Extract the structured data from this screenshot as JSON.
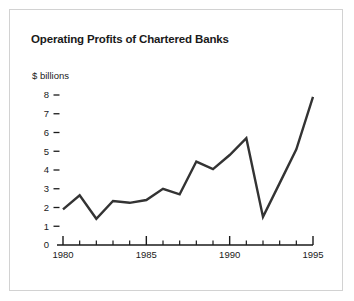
{
  "figure": {
    "title": "Operating Profits of Chartered Banks",
    "border_color": "#d2d2d2",
    "background": "#ffffff"
  },
  "chart_data": {
    "type": "line",
    "title": "Operating Profits of Chartered Banks",
    "xlabel": "",
    "ylabel": "$ billions",
    "ylabel_text": "$ billions",
    "x": [
      1980,
      1981,
      1982,
      1983,
      1984,
      1985,
      1986,
      1987,
      1988,
      1989,
      1990,
      1991,
      1992,
      1993,
      1994,
      1995
    ],
    "values": [
      1.9,
      2.65,
      1.4,
      2.35,
      2.25,
      2.4,
      3.0,
      2.7,
      4.45,
      4.05,
      4.8,
      5.7,
      1.5,
      3.3,
      5.1,
      7.9
    ],
    "series": [
      {
        "name": "Operating profits",
        "values": [
          1.9,
          2.65,
          1.4,
          2.35,
          2.25,
          2.4,
          3.0,
          2.7,
          4.45,
          4.05,
          4.8,
          5.7,
          1.5,
          3.3,
          5.1,
          7.9
        ]
      }
    ],
    "xlim": [
      1979,
      1995
    ],
    "ylim": [
      0,
      8
    ],
    "y_ticks": [
      0,
      1,
      2,
      3,
      4,
      5,
      6,
      7,
      8
    ],
    "y_tick_labels": [
      "0",
      "1",
      "2",
      "3",
      "4",
      "5",
      "6",
      "7",
      "8"
    ],
    "x_major_ticks": [
      1980,
      1985,
      1990,
      1995
    ],
    "x_major_tick_labels": [
      "1980",
      "1985",
      "1990",
      "1995"
    ],
    "x_minor_ticks": [
      1981,
      1982,
      1983,
      1984,
      1986,
      1987,
      1988,
      1989,
      1991,
      1992,
      1993,
      1994
    ],
    "grid": false,
    "legend": false,
    "line_color": "#333333",
    "axis_color": "#1a1a1a"
  }
}
